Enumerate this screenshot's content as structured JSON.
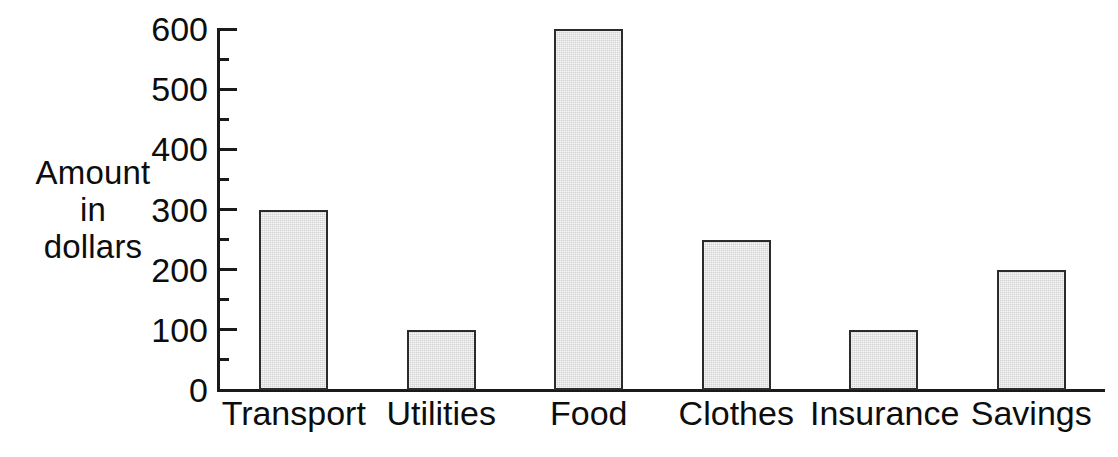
{
  "chart_data": {
    "type": "bar",
    "title": "",
    "xlabel": "",
    "ylabel": "Amount in dollars",
    "ylabel_lines": [
      "Amount",
      "in",
      "dollars"
    ],
    "categories": [
      "Transport",
      "Utilities",
      "Food",
      "Clothes",
      "Insurance",
      "Savings"
    ],
    "values": [
      300,
      100,
      600,
      250,
      100,
      200
    ],
    "ylim": [
      0,
      600
    ],
    "y_major_ticks": [
      0,
      100,
      200,
      300,
      400,
      500,
      600
    ],
    "y_minor_ticks": [
      50,
      150,
      250,
      350,
      450,
      550
    ],
    "y_tick_labels": [
      "0",
      "100",
      "200",
      "300",
      "400",
      "500",
      "600"
    ],
    "grid": false,
    "legend": false,
    "bar_fill_color": "#d2d2d2",
    "bar_border_color": "#2b2b2b",
    "axis_color": "#1a1a1a",
    "background_color": "#ffffff"
  }
}
